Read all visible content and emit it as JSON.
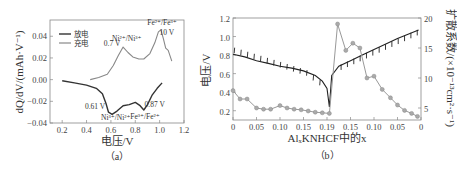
{
  "panels": {
    "a": {
      "caption": "（a）",
      "xlabel": "电压/V",
      "ylabel": "dQ/dV/(mAh·V⁻¹)",
      "legend": [
        {
          "label": "放电",
          "color": "#333333"
        },
        {
          "label": "充电",
          "color": "#888888"
        }
      ],
      "annotations": [
        {
          "text": "Fe²⁺/Fe³⁺",
          "x": 1.02,
          "y": 0.05
        },
        {
          "text": "10 V",
          "x": 1.06,
          "y": 0.041
        },
        {
          "text": "Ni²⁺/Ni³⁺",
          "x": 0.73,
          "y": 0.036
        },
        {
          "text": "0.7 V",
          "x": 0.61,
          "y": 0.031
        },
        {
          "text": "0.61 V",
          "x": 0.47,
          "y": -0.027
        },
        {
          "text": "Ni³⁺/Ni²⁺",
          "x": 0.64,
          "y": -0.037
        },
        {
          "text": "0.87 V",
          "x": 0.96,
          "y": -0.025
        },
        {
          "text": "Fe³⁺/Fe²⁺",
          "x": 0.88,
          "y": -0.036
        }
      ]
    },
    "b": {
      "caption": "（b）",
      "xlabel": "AlₓKNHCF中的x",
      "ylabel_left": "电压/V",
      "ylabel_right": "扩散系数/(×10⁻¹³cm²·s⁻¹)"
    }
  },
  "chart_data": [
    {
      "type": "line",
      "title": "",
      "xlabel": "电压/V",
      "ylabel": "dQ/dV/(mAh·V⁻¹)",
      "xlim": [
        0.1,
        1.2
      ],
      "ylim": [
        -0.04,
        0.055
      ],
      "xticks": [
        0.2,
        0.4,
        0.6,
        0.8,
        1.0,
        1.2
      ],
      "yticks": [
        -0.04,
        -0.02,
        0.0,
        0.02,
        0.04
      ],
      "ytick_labels": [
        "−0.04",
        "−0.02",
        "0.00",
        "0.02",
        "0.04"
      ],
      "legend_position": "upper left",
      "grid": false,
      "series": [
        {
          "name": "放电",
          "color": "#333333",
          "x": [
            0.2,
            0.3,
            0.4,
            0.48,
            0.53,
            0.56,
            0.58,
            0.61,
            0.65,
            0.7,
            0.75,
            0.8,
            0.84,
            0.87,
            0.9,
            0.94,
            0.98,
            1.02
          ],
          "y": [
            -0.001,
            -0.003,
            -0.005,
            -0.008,
            -0.013,
            -0.022,
            -0.03,
            -0.032,
            -0.029,
            -0.024,
            -0.023,
            -0.021,
            -0.024,
            -0.028,
            -0.023,
            -0.014,
            -0.008,
            -0.003
          ]
        },
        {
          "name": "充电",
          "color": "#888888",
          "x": [
            0.43,
            0.5,
            0.57,
            0.62,
            0.66,
            0.7,
            0.74,
            0.78,
            0.83,
            0.87,
            0.92,
            0.96,
            0.99,
            1.01,
            1.03,
            1.05,
            1.07,
            1.1
          ],
          "y": [
            0.0,
            0.002,
            0.005,
            0.013,
            0.022,
            0.03,
            0.025,
            0.021,
            0.019,
            0.019,
            0.024,
            0.034,
            0.044,
            0.046,
            0.038,
            0.029,
            0.027,
            0.017
          ]
        }
      ]
    },
    {
      "type": "line",
      "title": "",
      "xlabel": "AlₓKNHCF中的x",
      "ylabel": "电压/V",
      "ylabel_right": "扩散系数/(×10⁻¹³cm²·s⁻¹)",
      "categories": [
        "0",
        "0.05",
        "0.10",
        "0.15",
        "0.19",
        "0.15",
        "0.10",
        "0.05",
        "0"
      ],
      "xlim": [
        0,
        8
      ],
      "ylim": [
        0.1,
        1.2
      ],
      "ylim_right": [
        3,
        20
      ],
      "yticks": [
        0.2,
        0.4,
        0.6,
        0.8,
        1.0,
        1.2
      ],
      "yticks_right": [
        5,
        10,
        15,
        20
      ],
      "grid": false,
      "series": [
        {
          "name": "电压 (GITT)",
          "axis": "left",
          "color": "#222222",
          "x": [
            0,
            0.5,
            1,
            1.5,
            2,
            2.5,
            3,
            3.5,
            3.8,
            4.0,
            4.1,
            4.2,
            4.5,
            5,
            5.5,
            6,
            6.5,
            7,
            7.5,
            7.9
          ],
          "y": [
            0.81,
            0.78,
            0.74,
            0.71,
            0.68,
            0.66,
            0.63,
            0.58,
            0.52,
            0.44,
            0.24,
            0.58,
            0.68,
            0.74,
            0.8,
            0.86,
            0.92,
            0.98,
            1.03,
            1.07
          ]
        },
        {
          "name": "扩散系数",
          "axis": "right",
          "color": "#999999",
          "x": [
            0,
            0.3,
            0.6,
            1.0,
            1.3,
            1.6,
            2.0,
            2.3,
            2.6,
            2.9,
            3.2,
            3.5,
            3.8,
            4.1,
            4.45,
            4.8,
            5.1,
            5.4,
            5.7,
            6.0,
            6.35,
            6.7,
            7.0,
            7.3,
            7.6,
            7.85
          ],
          "y": [
            7.9,
            6.5,
            6.5,
            5.0,
            4.8,
            4.8,
            5.4,
            5.0,
            4.8,
            4.7,
            4.5,
            4.3,
            4.2,
            4.1,
            19.0,
            14.6,
            15.8,
            15.0,
            10.0,
            10.3,
            8.1,
            6.7,
            5.5,
            4.6,
            4.1,
            3.6
          ]
        }
      ]
    }
  ]
}
